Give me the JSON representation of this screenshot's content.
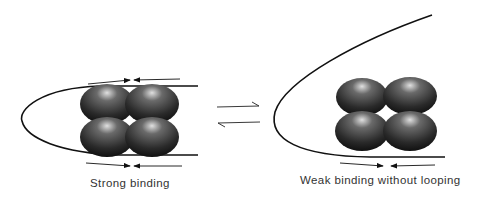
{
  "panels": [
    {
      "id": "left",
      "label": "Strong binding"
    },
    {
      "id": "right",
      "label": "Weak binding without looping"
    }
  ],
  "equilibrium": {
    "symbol": "reversible-arrows"
  },
  "colors": {
    "sphere_dark": "#1a1a1a",
    "sphere_light": "#d8d8d8",
    "line": "#111111"
  }
}
